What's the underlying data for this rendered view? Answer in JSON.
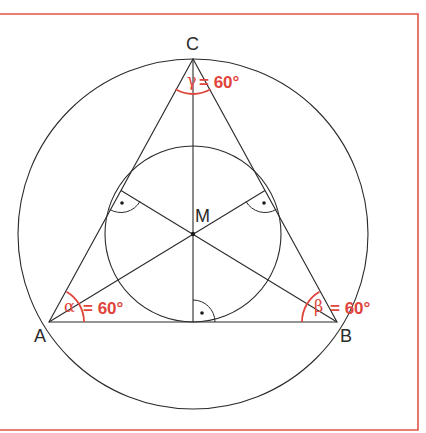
{
  "diagram": {
    "colors": {
      "frame": "#e2544a",
      "lines": "#2b2b2b",
      "angle": "#e0443c"
    },
    "vertices": {
      "A": {
        "label": "A",
        "x": 49,
        "y": 322
      },
      "B": {
        "label": "B",
        "x": 337,
        "y": 322
      },
      "C": {
        "label": "C",
        "x": 193,
        "y": 59
      }
    },
    "center": {
      "label": "M",
      "x": 193,
      "y": 234
    },
    "circumcircle": {
      "cx": 193,
      "cy": 234,
      "r": 175
    },
    "incircle": {
      "cx": 193,
      "cy": 234,
      "r": 88
    },
    "angles": {
      "alpha": {
        "symbol": "α",
        "value": "= 60°"
      },
      "beta": {
        "symbol": "β",
        "value": "= 60°"
      },
      "gamma": {
        "symbol": "γ",
        "value": "= 60°"
      }
    },
    "right_angle_markers": [
      "on AB",
      "on AC",
      "on BC"
    ]
  }
}
